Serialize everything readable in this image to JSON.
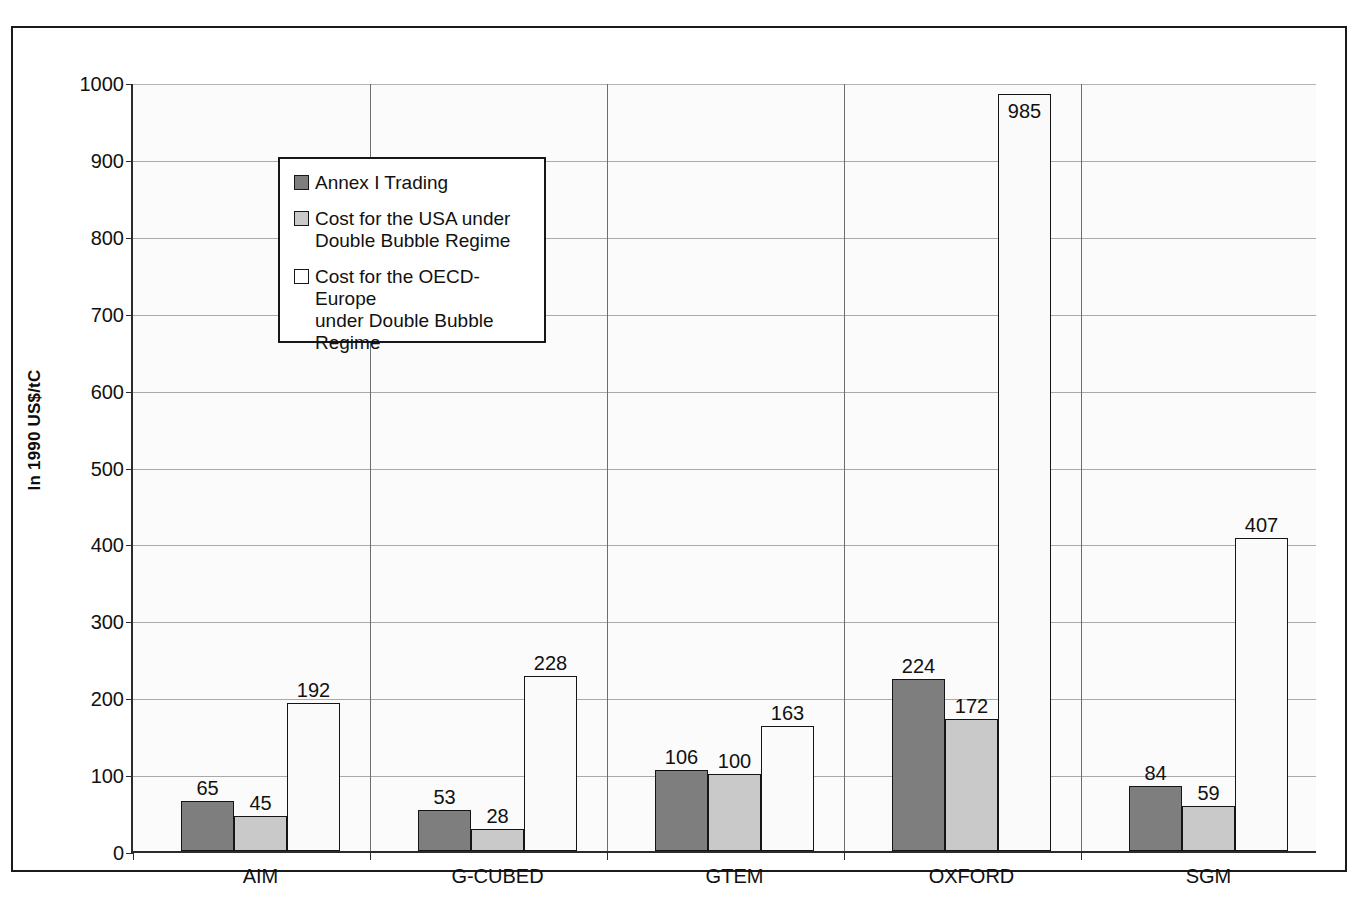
{
  "chart_data": {
    "type": "bar",
    "title": "",
    "xlabel": "",
    "ylabel": "In 1990 US$/tC",
    "ylim": [
      0,
      1000
    ],
    "ytick_step": 100,
    "yticks": [
      "1000",
      "900",
      "800",
      "700",
      "600",
      "500",
      "400",
      "300",
      "200",
      "100",
      "0"
    ],
    "grid": true,
    "legend_position": "upper-left-inside",
    "categories": [
      "AIM",
      "G-CUBED",
      "GTEM",
      "OXFORD",
      "SGM"
    ],
    "series": [
      {
        "name": "Annex I Trading",
        "color": "#7e7e7e",
        "values": [
          65,
          53,
          106,
          224,
          84
        ]
      },
      {
        "name": "Cost for the USA under Double Bubble Regime",
        "color": "#c9c9c9",
        "values": [
          45,
          28,
          100,
          172,
          59
        ]
      },
      {
        "name": "Cost for the OECD-Europe under Double Bubble Regime",
        "color": "#ffffff",
        "values": [
          192,
          228,
          163,
          985,
          407
        ]
      }
    ],
    "legend_entries": [
      "Annex I Trading",
      "Cost for the USA under Double Bubble Regime",
      "Cost for the OECD-Europe under Double Bubble Regime"
    ],
    "legend_lines": [
      [
        "Annex I Trading"
      ],
      [
        "Cost for the USA under",
        "Double Bubble Regime"
      ],
      [
        "Cost for the OECD-Europe",
        "under Double Bubble Regime"
      ]
    ],
    "data_labels": [
      [
        "65",
        "45",
        "192"
      ],
      [
        "53",
        "28",
        "228"
      ],
      [
        "106",
        "100",
        "163"
      ],
      [
        "224",
        "172",
        "985"
      ],
      [
        "84",
        "59",
        "407"
      ]
    ],
    "label_inside_bar": [
      [
        false,
        false,
        false
      ],
      [
        false,
        false,
        false
      ],
      [
        false,
        false,
        false
      ],
      [
        false,
        false,
        true
      ],
      [
        false,
        false,
        false
      ]
    ]
  },
  "colors": {
    "axis": "#2b2b2b",
    "gridline": "#a9a9a9",
    "plot_background": "#fbfbfb",
    "frame": "#1a1a1a"
  }
}
